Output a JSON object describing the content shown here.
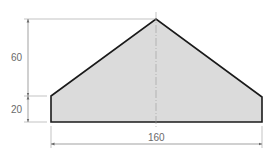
{
  "diagram": {
    "type": "dimensioned-drawing",
    "shape": "pentagon-house-profile",
    "dimensions": {
      "height_upper": "60",
      "height_lower": "20",
      "width": "160"
    },
    "colors": {
      "fill": "#dcdcdc",
      "outline": "#1a1a1a",
      "dimension_lines": "#8a8a8a",
      "text": "#6a6a6a"
    }
  }
}
